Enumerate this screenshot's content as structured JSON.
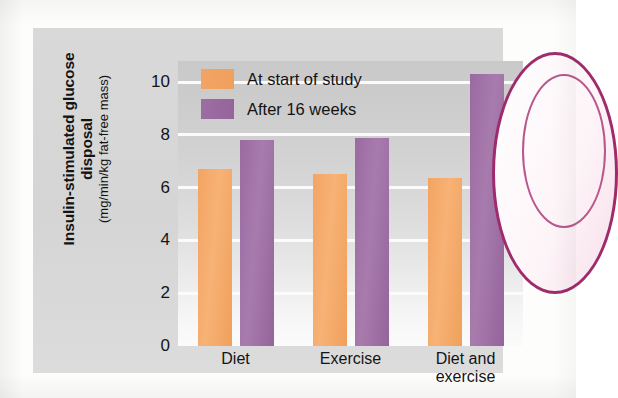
{
  "figure": {
    "y_axis_title_main": "Insulin-stimulated glucose disposal",
    "y_axis_title_units": "(mg/min/kg fat-free mass)"
  },
  "legend": {
    "position": "top-left-inside",
    "items": [
      {
        "label": "At start of study",
        "color": "#f0a05c",
        "key": "start"
      },
      {
        "label": "After 16 weeks",
        "color": "#94649b",
        "key": "after"
      }
    ]
  },
  "chart_data": {
    "type": "bar",
    "title": "",
    "xlabel": "",
    "ylabel": "Insulin-stimulated glucose disposal (mg/min/kg fat-free mass)",
    "categories": [
      "Diet",
      "Exercise",
      "Diet and exercise"
    ],
    "category_label_lines": [
      [
        "Diet"
      ],
      [
        "Exercise"
      ],
      [
        "Diet and",
        "exercise"
      ]
    ],
    "series": [
      {
        "name": "At start of study",
        "color": "#f0a05c",
        "values": [
          6.7,
          6.5,
          6.35
        ]
      },
      {
        "name": "After 16 weeks",
        "color": "#94649b",
        "values": [
          7.8,
          7.9,
          10.3
        ]
      }
    ],
    "ylim": [
      0,
      10.8
    ],
    "yticks": [
      0,
      2,
      4,
      6,
      8,
      10
    ],
    "ytick_labels": [
      "0",
      "2",
      "4",
      "6",
      "8",
      "10"
    ],
    "grid": true,
    "grid_color": "#fbfbfb",
    "legend_position": "upper left"
  }
}
